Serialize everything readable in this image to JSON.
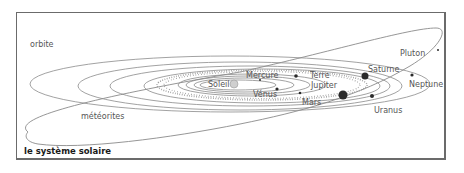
{
  "title": "le système solaire",
  "labels": {
    "orbit": "orbite",
    "meteorites": "météorites",
    "sun": "Soleil",
    "mercury": "Mercure",
    "venus": "Vénus",
    "earth": "Terre",
    "mars": "Mars",
    "jupiter": "Jupiter",
    "saturn": "Saturne",
    "uranus": "Uranus",
    "neptune": "Neptune",
    "pluto": "Pluton"
  },
  "colors": {
    "frame": "#6b6b6b",
    "orbit_line": "#8a8a8a",
    "planet": "#2a2a2a",
    "sun": "#cfcfcf",
    "text": "#555555",
    "title": "#1a1a1a"
  }
}
